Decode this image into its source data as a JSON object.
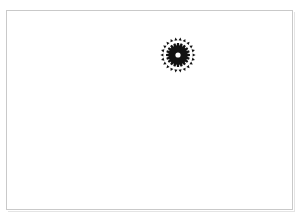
{
  "document": {
    "title": "Rosette emblem figure",
    "background_color": "#ffffff",
    "width": 301,
    "height": 222
  },
  "frame": {
    "name": "page-border",
    "border_color": "#c9c9c9",
    "shade_color": "#e4e4e4",
    "x": 6,
    "y": 10,
    "width": 287,
    "height": 200
  },
  "figure": {
    "name": "gear-rosette-emblem",
    "ink_color": "#111111",
    "center_x": 171,
    "center_y": 44,
    "diameter": 38,
    "hub": {
      "teeth": 20,
      "outer_radius": 12.0,
      "root_radius": 9.0,
      "tooth_width_deg": 10,
      "center_hole_radius": 2.6,
      "center_hole_color": "#ffffff"
    },
    "outer_ring": {
      "marks": 22,
      "radius": 15.8,
      "mark_size": 2.1,
      "shape": "wedge-dot"
    }
  },
  "chart_data": {
    "type": "scatter",
    "title": "",
    "xlabel": "",
    "ylabel": "",
    "series": [
      {
        "name": "hub-teeth",
        "count": 20,
        "radius": 12.0,
        "angles_deg": [
          0,
          18,
          36,
          54,
          72,
          90,
          108,
          126,
          144,
          162,
          180,
          198,
          216,
          234,
          252,
          270,
          288,
          306,
          324,
          342
        ]
      },
      {
        "name": "outer-ring-marks",
        "count": 22,
        "radius": 15.8,
        "angles_deg": [
          0,
          16.36,
          32.73,
          49.09,
          65.45,
          81.82,
          98.18,
          114.55,
          130.91,
          147.27,
          163.64,
          180,
          196.36,
          212.73,
          229.09,
          245.45,
          261.82,
          278.18,
          294.55,
          310.91,
          327.27,
          343.64
        ]
      }
    ]
  }
}
